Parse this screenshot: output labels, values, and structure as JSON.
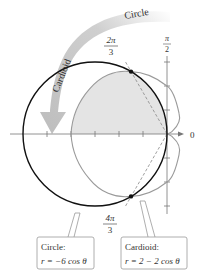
{
  "diagram": {
    "type": "polar-graph",
    "arrow_label_start": "Circle",
    "arrow_label_end": "Cardioid",
    "angle_labels": {
      "top_num": "π",
      "top_den": "2",
      "right": "0",
      "upper_num": "2π",
      "upper_den": "3",
      "lower_num": "4π",
      "lower_den": "3"
    },
    "callouts": {
      "circle": {
        "title": "Circle:",
        "equation": "r = −6 cos θ"
      },
      "cardioid": {
        "title": "Cardioid:",
        "equation": "r = 2 − 2 cos θ"
      }
    },
    "colors": {
      "circle_stroke": "#111111",
      "cardioid_stroke": "#9a9a9a",
      "shaded_fill": "#e4e4e4",
      "axis": "#777777",
      "arrow": "#c8c8c8"
    },
    "intersection_points": [
      "2π/3",
      "4π/3"
    ]
  }
}
